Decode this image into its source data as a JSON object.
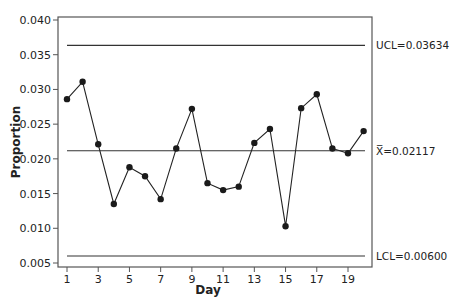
{
  "chart_data": {
    "type": "line",
    "title": "",
    "xlabel": "Day",
    "ylabel": "Proportion",
    "x": [
      1,
      2,
      3,
      4,
      5,
      6,
      7,
      8,
      9,
      10,
      11,
      12,
      13,
      14,
      15,
      16,
      17,
      18,
      19,
      20
    ],
    "series": [
      {
        "name": "Proportion",
        "values": [
          0.0286,
          0.0311,
          0.0221,
          0.0135,
          0.0188,
          0.0175,
          0.0142,
          0.0215,
          0.0272,
          0.0165,
          0.0155,
          0.016,
          0.0223,
          0.0243,
          0.0103,
          0.0273,
          0.0293,
          0.0215,
          0.0208,
          0.024
        ]
      }
    ],
    "x_ticks": [
      "1",
      "3",
      "5",
      "7",
      "9",
      "11",
      "13",
      "15",
      "17",
      "19"
    ],
    "y_ticks": [
      "0.005",
      "0.010",
      "0.015",
      "0.020",
      "0.025",
      "0.030",
      "0.035",
      "0.040"
    ],
    "ylim": [
      0.005,
      0.04
    ],
    "xlim": [
      1,
      20
    ],
    "grid": false,
    "reference_lines": [
      {
        "name": "UCL",
        "value": 0.03634,
        "label": "UCL=0.03634"
      },
      {
        "name": "Center",
        "value": 0.02117,
        "label": "X̅=0.02117"
      },
      {
        "name": "LCL",
        "value": 0.006,
        "label": "LCL=0.00600"
      }
    ],
    "legend": "none"
  },
  "colors": {
    "line": "#222222",
    "axis": "#555555",
    "reference": "#333333"
  }
}
